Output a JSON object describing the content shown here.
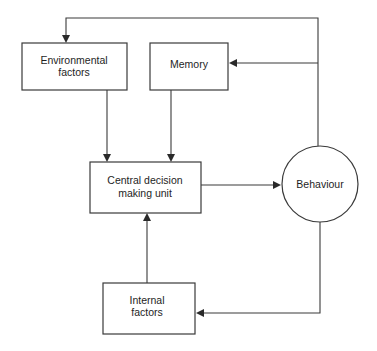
{
  "diagram": {
    "nodes": {
      "environmental": {
        "line1": "Environmental",
        "line2": "factors",
        "shape": "rectangle"
      },
      "memory": {
        "line1": "Memory",
        "shape": "rectangle"
      },
      "central": {
        "line1": "Central decision",
        "line2": "making unit",
        "shape": "rectangle"
      },
      "behaviour": {
        "line1": "Behaviour",
        "shape": "circle"
      },
      "internal": {
        "line1": "Internal",
        "line2": "factors",
        "shape": "rectangle"
      }
    },
    "edges": [
      {
        "from": "Environmental factors",
        "to": "Central decision making unit"
      },
      {
        "from": "Memory",
        "to": "Central decision making unit"
      },
      {
        "from": "Internal factors",
        "to": "Central decision making unit"
      },
      {
        "from": "Central decision making unit",
        "to": "Behaviour"
      },
      {
        "from": "Behaviour",
        "to": "Environmental factors"
      },
      {
        "from": "Behaviour",
        "to": "Memory"
      },
      {
        "from": "Behaviour",
        "to": "Internal factors"
      }
    ]
  }
}
